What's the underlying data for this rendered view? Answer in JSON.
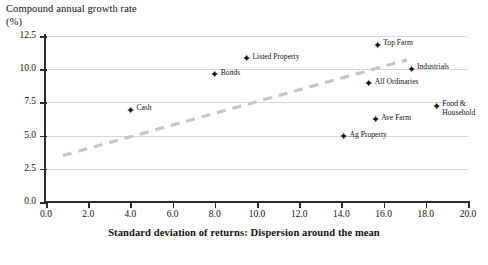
{
  "chart_data": {
    "type": "scatter",
    "title": "",
    "ylabel": "Compound annual growth rate (%)",
    "ylabel_line1": "Compound annual growth rate",
    "ylabel_line2": "(%)",
    "xlabel": "Standard deviation of returns: Dispersion around the mean",
    "xlim": [
      0.0,
      20.0
    ],
    "ylim": [
      0.0,
      12.5
    ],
    "xticks": [
      "0.0",
      "2.0",
      "4.0",
      "6.0",
      "8.0",
      "10.0",
      "12.0",
      "14.0",
      "16.0",
      "18.0",
      "20.0"
    ],
    "xtick_values": [
      0.0,
      2.0,
      4.0,
      6.0,
      8.0,
      10.0,
      12.0,
      14.0,
      16.0,
      18.0,
      20.0
    ],
    "yticks": [
      "0.0",
      "2.5",
      "5.0",
      "7.5",
      "10.0",
      "12.5"
    ],
    "ytick_values": [
      0.0,
      2.5,
      5.0,
      7.5,
      10.0,
      12.5
    ],
    "grid": "horizontal",
    "legend": "none",
    "points": [
      {
        "label": "Cash",
        "x": 4.0,
        "y": 6.9,
        "label_pos": "right"
      },
      {
        "label": "Bonds",
        "x": 8.0,
        "y": 9.6,
        "label_pos": "right"
      },
      {
        "label": "Listed Property",
        "x": 9.5,
        "y": 10.8,
        "label_pos": "right"
      },
      {
        "label": "Ag Property",
        "x": 14.1,
        "y": 4.9,
        "label_pos": "right"
      },
      {
        "label": "All Ordinaries",
        "x": 15.3,
        "y": 8.9,
        "label_pos": "right"
      },
      {
        "label": "Ave Farm",
        "x": 15.6,
        "y": 6.2,
        "label_pos": "right"
      },
      {
        "label": "Top Farm",
        "x": 15.7,
        "y": 11.8,
        "label_pos": "right"
      },
      {
        "label": "Industrials",
        "x": 17.3,
        "y": 10.0,
        "label_pos": "right"
      },
      {
        "label": "Food & Household",
        "x": 18.5,
        "y": 7.2,
        "label_pos": "right",
        "wrap": true
      }
    ],
    "trendline": {
      "style": "dashed",
      "color": "#c6c6c6",
      "x_start": 0.8,
      "y_start": 3.5,
      "x_end": 17.1,
      "y_end": 10.7
    },
    "marker": {
      "shape": "diamond-four-point",
      "color": "#111111"
    }
  },
  "caption": {
    "text": ""
  }
}
